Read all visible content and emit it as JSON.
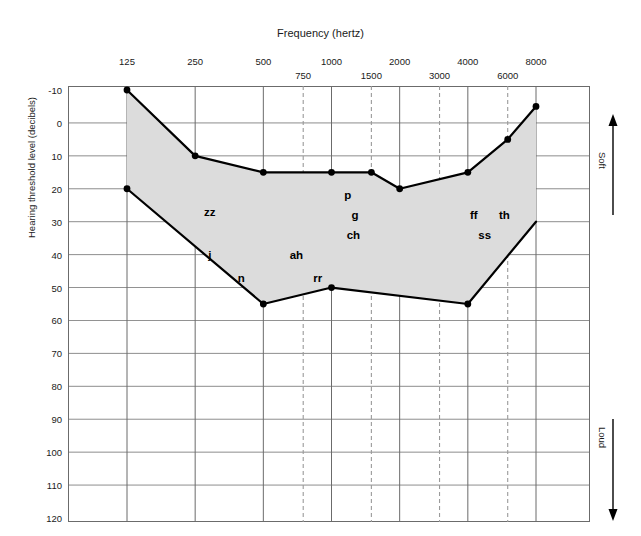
{
  "chart_data": {
    "type": "area",
    "title": "",
    "xlabel": "Frequency (hertz)",
    "ylabel": "Hearing threshold level (decibels)",
    "x_ticks_primary": [
      "125",
      "250",
      "500",
      "1000",
      "2000",
      "4000",
      "8000"
    ],
    "x_ticks_secondary": [
      "750",
      "1500",
      "3000",
      "6000"
    ],
    "x_positions_primary": [
      125,
      250,
      500,
      1000,
      2000,
      4000,
      8000
    ],
    "x_positions_secondary": [
      750,
      1500,
      3000,
      6000
    ],
    "y_ticks": [
      "-10",
      "0",
      "10",
      "20",
      "30",
      "40",
      "50",
      "60",
      "70",
      "80",
      "90",
      "100",
      "110",
      "120"
    ],
    "ylim": [
      -10,
      120
    ],
    "y_inverted": true,
    "grid": true,
    "grid_solid_frequencies": [
      125,
      250,
      500,
      1000,
      2000,
      4000,
      8000
    ],
    "grid_dashed_frequencies": [
      750,
      1500,
      3000,
      6000
    ],
    "series": [
      {
        "name": "upper boundary",
        "x": [
          125,
          250,
          500,
          1000,
          1500,
          2000,
          4000,
          6000,
          8000
        ],
        "values": [
          -10,
          10,
          15,
          15,
          15,
          20,
          15,
          5,
          -5
        ],
        "markers": true
      },
      {
        "name": "lower boundary",
        "x": [
          125,
          500,
          1000,
          4000,
          8000
        ],
        "values": [
          20,
          55,
          50,
          55,
          30
        ],
        "markers": true,
        "last_marker": false
      }
    ],
    "fill_color": "#dcdcdc",
    "line_color": "#000000",
    "annotations": [
      {
        "text": "zz",
        "x": 290,
        "y": 27
      },
      {
        "text": "j",
        "x": 290,
        "y": 40
      },
      {
        "text": "n",
        "x": 400,
        "y": 47
      },
      {
        "text": "ah",
        "x": 700,
        "y": 40
      },
      {
        "text": "rr",
        "x": 870,
        "y": 47
      },
      {
        "text": "p",
        "x": 1180,
        "y": 22
      },
      {
        "text": "g",
        "x": 1270,
        "y": 28
      },
      {
        "text": "ch",
        "x": 1250,
        "y": 34
      },
      {
        "text": "ff",
        "x": 4250,
        "y": 28
      },
      {
        "text": "ss",
        "x": 4750,
        "y": 34
      },
      {
        "text": "th",
        "x": 5800,
        "y": 28
      }
    ],
    "axis_arrows": [
      {
        "label": "Soft",
        "direction": "up",
        "position": "right-top"
      },
      {
        "label": "Loud",
        "direction": "down",
        "position": "right-bottom"
      }
    ]
  },
  "colors": {
    "fill": "#dcdcdc",
    "line": "#000000",
    "grid_solid": "#6b6b6b",
    "grid_dashed": "#9a9a9a",
    "border": "#6b6b6b",
    "text": "#1a1a1a"
  }
}
